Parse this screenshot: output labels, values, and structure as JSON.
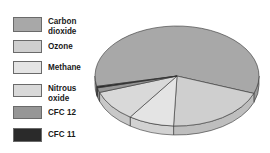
{
  "caption": "",
  "legend": {
    "items": [
      {
        "label_line1": "Carbon",
        "label_line2": "dioxide",
        "color": "#a8a8a8"
      },
      {
        "label_line1": "Ozone",
        "label_line2": "",
        "color": "#cfcfcf"
      },
      {
        "label_line1": "Methane",
        "label_line2": "",
        "color": "#e4e4e4"
      },
      {
        "label_line1": "Nitrous",
        "label_line2": "oxide",
        "color": "#d9d9d9"
      },
      {
        "label_line1": "CFC 12",
        "label_line2": "",
        "color": "#969696"
      },
      {
        "label_line1": "CFC 11",
        "label_line2": "",
        "color": "#2a2a2a"
      }
    ]
  },
  "chart_data": {
    "type": "pie",
    "style": "3d",
    "title": "",
    "categories": [
      "Carbon dioxide",
      "Ozone",
      "Methane",
      "Nitrous oxide",
      "CFC 12",
      "CFC 11"
    ],
    "values": [
      59,
      20,
      9,
      10,
      1.5,
      0.5
    ],
    "units": "percent (estimated from slice angles)",
    "colors": [
      "#a8a8a8",
      "#cfcfcf",
      "#e4e4e4",
      "#d9d9d9",
      "#969696",
      "#2a2a2a"
    ],
    "legend_position": "left",
    "data_labels": false
  }
}
